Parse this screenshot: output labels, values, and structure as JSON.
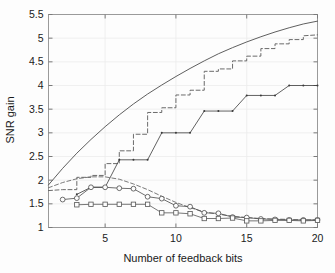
{
  "chart_data": {
    "type": "line",
    "title": "",
    "xlabel": "Number of feedback bits",
    "ylabel": "SNR gain",
    "xlim": [
      1,
      20
    ],
    "ylim": [
      1,
      5.5
    ],
    "xticks": [
      5,
      10,
      15,
      20
    ],
    "xtick_labels": [
      "5",
      "10",
      "15",
      "20"
    ],
    "yticks": [
      1,
      1.5,
      2,
      2.5,
      3,
      3.5,
      4,
      4.5,
      5,
      5.5
    ],
    "ytick_labels": [
      "1",
      "1.5",
      "2",
      "2.5",
      "3",
      "3.5",
      "4",
      "4.5",
      "5",
      "5.5"
    ],
    "grid": true,
    "legend": "none",
    "series": [
      {
        "name": "upper-bound-solid",
        "style": "solid",
        "marker": "none",
        "color": "#4d4d4d",
        "x": [
          1,
          2,
          3,
          4,
          5,
          6,
          7,
          8,
          9,
          10,
          11,
          12,
          13,
          14,
          15,
          16,
          17,
          18,
          19,
          20
        ],
        "y": [
          1.9,
          2.25,
          2.57,
          2.86,
          3.13,
          3.38,
          3.61,
          3.82,
          4.01,
          4.19,
          4.36,
          4.52,
          4.67,
          4.8,
          4.92,
          5.03,
          5.13,
          5.22,
          5.3,
          5.36
        ]
      },
      {
        "name": "staircase-dashed",
        "style": "dashed",
        "marker": "none",
        "color": "#5a5a5a",
        "x": [
          1,
          2,
          3,
          3,
          4,
          4,
          5,
          5,
          6,
          6,
          7,
          7,
          8,
          8,
          9,
          9,
          10,
          10,
          11,
          11,
          12,
          12,
          13,
          13,
          14,
          14,
          15,
          15,
          16,
          16,
          17,
          17,
          18,
          18,
          19,
          19,
          20
        ],
        "y": [
          1.78,
          1.8,
          1.8,
          2.06,
          2.06,
          2.1,
          2.1,
          2.35,
          2.35,
          2.62,
          2.62,
          2.97,
          2.97,
          3.43,
          3.43,
          3.53,
          3.53,
          3.8,
          3.8,
          3.9,
          3.9,
          4.3,
          4.3,
          4.35,
          4.35,
          4.52,
          4.52,
          4.62,
          4.62,
          4.78,
          4.78,
          4.88,
          4.88,
          4.97,
          4.97,
          5.05,
          5.07
        ]
      },
      {
        "name": "early-dashed-hump",
        "style": "dashed",
        "marker": "none",
        "color": "#6a6a6a",
        "x": [
          1,
          2,
          3,
          4,
          5,
          6,
          7,
          8,
          9,
          10,
          11,
          12,
          13,
          14,
          15,
          16,
          17,
          18,
          19,
          20
        ],
        "y": [
          1.84,
          1.95,
          2.03,
          2.07,
          2.07,
          2.02,
          1.92,
          1.8,
          1.66,
          1.53,
          1.42,
          1.33,
          1.28,
          1.24,
          1.21,
          1.19,
          1.18,
          1.17,
          1.16,
          1.16
        ]
      },
      {
        "name": "staircase-dot-marker",
        "style": "solid",
        "marker": "dot",
        "color": "#3a3a3a",
        "x": [
          3,
          4,
          5,
          6,
          7,
          8,
          9,
          10,
          11,
          12,
          13,
          14,
          15,
          16,
          17,
          18,
          19,
          20
        ],
        "y": [
          1.7,
          1.85,
          1.85,
          2.43,
          2.43,
          2.43,
          3.0,
          3.0,
          3.0,
          3.46,
          3.46,
          3.46,
          3.79,
          3.79,
          3.79,
          4.0,
          4.0,
          4.0
        ]
      },
      {
        "name": "circle-marker-curve",
        "style": "solid",
        "marker": "circle",
        "color": "#4a4a4a",
        "x": [
          2,
          3,
          4,
          5,
          6,
          7,
          8,
          9,
          10,
          11,
          12,
          13,
          14,
          15,
          16,
          17,
          18,
          19,
          20
        ],
        "y": [
          1.59,
          1.62,
          1.85,
          1.85,
          1.83,
          1.82,
          1.65,
          1.61,
          1.46,
          1.44,
          1.31,
          1.3,
          1.22,
          1.21,
          1.18,
          1.17,
          1.16,
          1.16,
          1.16
        ]
      },
      {
        "name": "square-marker-curve",
        "style": "solid",
        "marker": "square",
        "color": "#555555",
        "x": [
          3,
          4,
          5,
          6,
          7,
          8,
          9,
          10,
          11,
          12,
          13,
          14,
          15,
          16,
          17,
          18,
          19,
          20
        ],
        "y": [
          1.48,
          1.49,
          1.49,
          1.49,
          1.49,
          1.49,
          1.31,
          1.31,
          1.29,
          1.19,
          1.19,
          1.2,
          1.14,
          1.14,
          1.15,
          1.15,
          1.14,
          1.15
        ]
      }
    ]
  },
  "axes": {
    "xlabel": "Number of feedback bits",
    "ylabel": "SNR gain"
  }
}
